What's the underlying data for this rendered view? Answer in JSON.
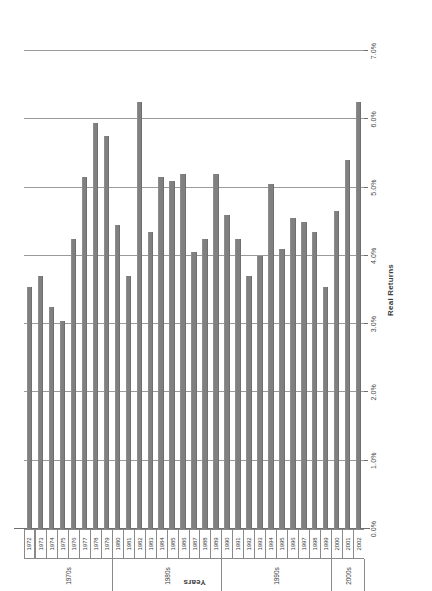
{
  "chart_data": {
    "type": "bar",
    "orientation": "horizontal",
    "title": "",
    "xlabel": "Real Returns",
    "ylabel": "Years",
    "xlim": [
      0,
      7
    ],
    "xticks": [
      "0.0%",
      "1.0%",
      "2.0%",
      "3.0%",
      "4.0%",
      "5.0%",
      "6.0%",
      "7.0%"
    ],
    "xtick_values": [
      0,
      1,
      2,
      3,
      4,
      5,
      6,
      7
    ],
    "grid": true,
    "legend": "none",
    "bar_color": "#808080",
    "categories": [
      "1972",
      "1973",
      "1974",
      "1975",
      "1976",
      "1977",
      "1978",
      "1979",
      "1980",
      "1981",
      "1982",
      "1983",
      "1984",
      "1985",
      "1986",
      "1987",
      "1988",
      "1989",
      "1990",
      "1991",
      "1992",
      "1993",
      "1994",
      "1995",
      "1996",
      "1997",
      "1998",
      "1999",
      "2000",
      "2001",
      "2002"
    ],
    "values": [
      3.55,
      3.7,
      3.25,
      3.05,
      4.25,
      5.15,
      5.95,
      5.75,
      4.45,
      3.7,
      6.25,
      4.35,
      5.15,
      5.1,
      5.2,
      4.05,
      4.25,
      5.2,
      4.6,
      4.25,
      3.7,
      4.0,
      5.05,
      4.1,
      4.55,
      4.5,
      4.35,
      3.55,
      4.65,
      5.4,
      6.25
    ],
    "group_labels": [
      {
        "label": "1970s",
        "start": "1972",
        "end": "1979"
      },
      {
        "label": "1980s",
        "start": "1980",
        "end": "1989"
      },
      {
        "label": "1990s",
        "start": "1990",
        "end": "1999"
      },
      {
        "label": "2000s",
        "start": "2000",
        "end": "2002"
      }
    ]
  },
  "axes": {
    "value_axis_title": "Real Returns",
    "category_axis_title": "Years"
  }
}
